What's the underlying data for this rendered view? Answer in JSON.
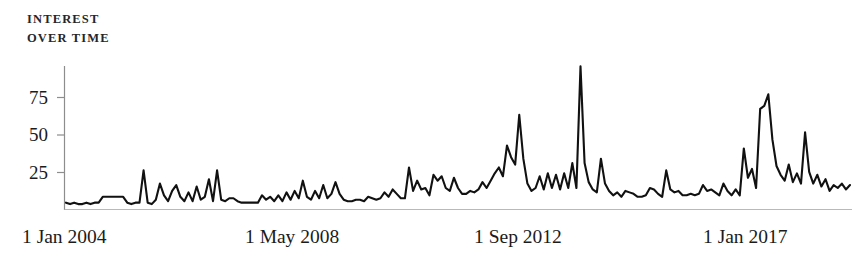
{
  "chart_data": {
    "type": "line",
    "title": "INTEREST\nOVER TIME",
    "xlabel": "",
    "ylabel": "",
    "ylim": [
      0,
      100
    ],
    "yticks": [
      25,
      50,
      75
    ],
    "ytick_labels": [
      "25",
      "50",
      "75"
    ],
    "grid": false,
    "legend": "none",
    "axis_color": "#7a7a7a",
    "line_color": "#111111",
    "background": "#ffffff",
    "x_tick_labels": [
      "1 Jan 2004",
      "1 May 2008",
      "1 Sep 2012",
      "1 Jan 2017"
    ],
    "x_tick_positions": [
      0,
      52,
      104,
      156
    ],
    "x_start": "1 Jan 2004",
    "x_end": "1 Jan 2018",
    "series": [
      {
        "name": "Interest over time",
        "values": [
          4,
          3,
          4,
          3,
          3,
          4,
          3,
          4,
          4,
          8,
          8,
          8,
          8,
          8,
          8,
          4,
          3,
          4,
          4,
          26,
          4,
          3,
          6,
          17,
          9,
          5,
          12,
          16,
          8,
          5,
          11,
          5,
          15,
          6,
          8,
          20,
          5,
          26,
          6,
          5,
          7,
          7,
          5,
          4,
          4,
          4,
          4,
          4,
          9,
          6,
          8,
          5,
          9,
          5,
          11,
          6,
          12,
          7,
          19,
          8,
          6,
          12,
          7,
          16,
          7,
          10,
          18,
          10,
          6,
          5,
          5,
          6,
          6,
          5,
          8,
          7,
          6,
          7,
          11,
          8,
          13,
          10,
          7,
          7,
          28,
          12,
          19,
          13,
          14,
          9,
          23,
          19,
          22,
          14,
          12,
          21,
          14,
          10,
          10,
          12,
          11,
          13,
          18,
          14,
          19,
          24,
          28,
          22,
          43,
          35,
          30,
          64,
          34,
          17,
          12,
          14,
          22,
          13,
          24,
          14,
          23,
          13,
          24,
          14,
          31,
          14,
          97,
          31,
          18,
          13,
          11,
          34,
          17,
          12,
          9,
          11,
          8,
          12,
          11,
          10,
          8,
          8,
          9,
          14,
          13,
          10,
          8,
          26,
          13,
          11,
          12,
          9,
          9,
          10,
          9,
          10,
          16,
          12,
          13,
          11,
          9,
          17,
          12,
          9,
          13,
          9,
          41,
          21,
          27,
          14,
          68,
          70,
          78,
          47,
          29,
          23,
          19,
          30,
          18,
          24,
          17,
          52,
          25,
          17,
          23,
          15,
          20,
          12,
          16,
          14,
          17,
          13,
          16
        ]
      }
    ]
  }
}
